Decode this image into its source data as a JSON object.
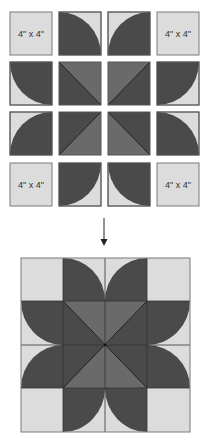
{
  "colors": {
    "light": "#dcdcdc",
    "dark": "#4a4a4a",
    "medium": "#6a6a6a",
    "stroke": "#7a7a7a",
    "line": "#222222",
    "arrow": "#222222",
    "background": "#ffffff"
  },
  "top_grid": {
    "label_text": "4\" x 4\"",
    "rows": [
      [
        "plain-labeled",
        "quarter-circle-tl-bottom-right-arc",
        "quarter-circle-tr-bottom-left-arc",
        "plain-labeled"
      ],
      [
        "quarter-circle-top-left-arc",
        "hst-tl-br",
        "hst-tr-bl",
        "quarter-circle-top-right-arc"
      ],
      [
        "quarter-circle-bottom-left-arc",
        "hst-tr-bl-b",
        "hst-tl-br-b",
        "quarter-circle-bottom-right-arc"
      ],
      [
        "plain-labeled",
        "quarter-circle-top-left-down",
        "quarter-circle-top-right-down",
        "plain-labeled"
      ]
    ],
    "labels": [
      {
        "row": 0,
        "col": 0,
        "text": "4\" x 4\""
      },
      {
        "row": 0,
        "col": 3,
        "text": "4\" x 4\""
      },
      {
        "row": 3,
        "col": 0,
        "text": "4\" x 4\""
      },
      {
        "row": 3,
        "col": 3,
        "text": "4\" x 4\""
      }
    ]
  },
  "arrow": {
    "direction": "down",
    "semantic": "arrow-down-icon"
  },
  "assembled_block": {
    "description": "Assembled 4x4 quilt block forming a four-petal flower star",
    "grid": "4x4"
  }
}
